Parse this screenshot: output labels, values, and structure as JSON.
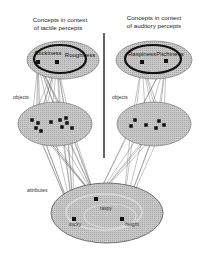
{
  "diagram": {
    "tactile": {
      "title_line1": "Concepts in context",
      "title_line2": "of tactile percepts",
      "concepts": [
        "Stickiness",
        "Roughness"
      ],
      "objects_label": "objects",
      "object_count": 10
    },
    "auditory": {
      "title_line1": "Concepts in context",
      "title_line2": "of auditory percepts",
      "concepts": [
        "Raspiness",
        "Pitchiness"
      ],
      "objects_label": "objects",
      "object_count": 6
    },
    "attributes": {
      "label": "attributes",
      "items": [
        "sticky",
        "raspy",
        "height"
      ]
    },
    "colors": {
      "ellipse_fill": "#bdbdbd",
      "ink": "#111111",
      "line": "#555555"
    }
  }
}
